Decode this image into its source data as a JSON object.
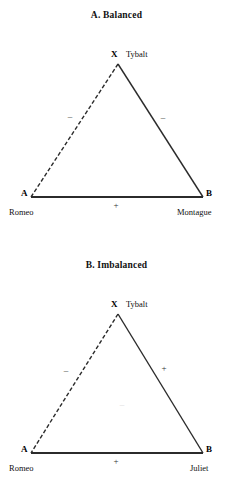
{
  "figure": {
    "panels": [
      {
        "id": "panel-a",
        "title": "A.  Balanced",
        "apex": {
          "letter": "X",
          "name": "Tybalt",
          "letter_left": 111,
          "letter_top": 50,
          "name_left": 126,
          "name_top": 50
        },
        "left_vertex": {
          "letter": "A",
          "name": "Romeo",
          "letter_left": 21,
          "letter_top": 189,
          "name_left": 9,
          "name_top": 208
        },
        "right_vertex": {
          "letter": "B",
          "name": "Montague",
          "letter_left": 206,
          "letter_top": 189,
          "name_left": 177,
          "name_top": 208
        },
        "edges": [
          {
            "name": "edge-apex-to-left",
            "style": "dashed",
            "sign": "–",
            "sign_left": 63,
            "sign_top": 112
          },
          {
            "name": "edge-apex-to-right",
            "style": "solid",
            "sign": "–",
            "sign_left": 156,
            "sign_top": 113
          },
          {
            "name": "edge-left-to-right",
            "style": "solid",
            "sign": "+",
            "sign_left": 109,
            "sign_top": 201
          }
        ],
        "interior_sign": null
      },
      {
        "id": "panel-b",
        "title": "B.  Imbalanced",
        "apex": {
          "letter": "X",
          "name": "Tybalt",
          "letter_left": 111,
          "letter_top": 58,
          "name_left": 126,
          "name_top": 58
        },
        "left_vertex": {
          "letter": "A",
          "name": "Romeo",
          "letter_left": 21,
          "letter_top": 203,
          "name_left": 9,
          "name_top": 222
        },
        "right_vertex": {
          "letter": "B",
          "name": "Juliet",
          "letter_left": 206,
          "letter_top": 203,
          "name_left": 190,
          "name_top": 222
        },
        "edges": [
          {
            "name": "edge-apex-to-left",
            "style": "dashed",
            "sign": "–",
            "sign_left": 59,
            "sign_top": 124
          },
          {
            "name": "edge-apex-to-right",
            "style": "solid",
            "sign": "+",
            "sign_left": 157,
            "sign_top": 122
          },
          {
            "name": "edge-left-to-right",
            "style": "solid",
            "sign": "+",
            "sign_left": 109,
            "sign_top": 215
          }
        ],
        "interior_sign": {
          "text": "–",
          "sign_left": 115,
          "sign_top": 158
        }
      }
    ],
    "colors": {
      "ink": "#1a1a1a",
      "line": "#2b2b2b",
      "background": "#ffffff",
      "faint": "#d8d8d8"
    }
  }
}
